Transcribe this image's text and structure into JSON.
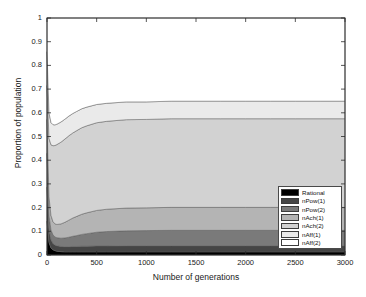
{
  "chart_data": {
    "type": "area",
    "stacked": true,
    "title": "",
    "xlabel": "Number of generations",
    "ylabel": "Proportion of population",
    "xlim": [
      0,
      3000
    ],
    "ylim": [
      0,
      1
    ],
    "xticks": [
      0,
      500,
      1000,
      1500,
      2000,
      2500,
      3000
    ],
    "yticks": [
      "0",
      "0.1",
      "0.2",
      "0.3",
      "0.4",
      "0.5",
      "0.6",
      "0.7",
      "0.8",
      "0.9",
      "1"
    ],
    "grid": false,
    "legend_position": "lower right",
    "x": [
      0,
      20,
      40,
      60,
      80,
      100,
      140,
      180,
      220,
      260,
      300,
      350,
      400,
      500,
      600,
      800,
      1000,
      1250,
      1500,
      1750,
      2000,
      2250,
      2500,
      2750,
      3000
    ],
    "series": [
      {
        "name": "Rational",
        "color": "#000000",
        "values": [
          0.143,
          0.052,
          0.03,
          0.022,
          0.018,
          0.016,
          0.014,
          0.013,
          0.013,
          0.013,
          0.013,
          0.013,
          0.013,
          0.013,
          0.013,
          0.013,
          0.013,
          0.013,
          0.013,
          0.013,
          0.013,
          0.013,
          0.013,
          0.013,
          0.013
        ]
      },
      {
        "name": "nPow(1)",
        "color": "#454545",
        "values": [
          0.143,
          0.055,
          0.034,
          0.027,
          0.024,
          0.023,
          0.022,
          0.022,
          0.022,
          0.023,
          0.023,
          0.024,
          0.024,
          0.025,
          0.025,
          0.026,
          0.026,
          0.026,
          0.026,
          0.026,
          0.026,
          0.026,
          0.026,
          0.026,
          0.026
        ]
      },
      {
        "name": "nPow(2)",
        "color": "#7a7a7a",
        "values": [
          0.143,
          0.06,
          0.042,
          0.036,
          0.034,
          0.034,
          0.035,
          0.037,
          0.04,
          0.043,
          0.046,
          0.05,
          0.053,
          0.058,
          0.061,
          0.063,
          0.064,
          0.065,
          0.065,
          0.065,
          0.065,
          0.065,
          0.065,
          0.065,
          0.065
        ]
      },
      {
        "name": "nAch(1)",
        "color": "#b4b4b4",
        "values": [
          0.143,
          0.079,
          0.061,
          0.056,
          0.055,
          0.056,
          0.06,
          0.066,
          0.072,
          0.077,
          0.081,
          0.085,
          0.088,
          0.092,
          0.094,
          0.096,
          0.096,
          0.097,
          0.097,
          0.097,
          0.097,
          0.097,
          0.097,
          0.097,
          0.097
        ]
      },
      {
        "name": "nAch(2)",
        "color": "#d2d2d2",
        "values": [
          0.143,
          0.246,
          0.298,
          0.32,
          0.331,
          0.337,
          0.345,
          0.351,
          0.356,
          0.359,
          0.362,
          0.365,
          0.367,
          0.37,
          0.371,
          0.373,
          0.373,
          0.374,
          0.374,
          0.374,
          0.374,
          0.374,
          0.374,
          0.374,
          0.374
        ]
      },
      {
        "name": "nAff(1)",
        "color": "#eaeaea",
        "values": [
          0.143,
          0.108,
          0.094,
          0.089,
          0.087,
          0.086,
          0.085,
          0.084,
          0.083,
          0.082,
          0.081,
          0.08,
          0.079,
          0.077,
          0.076,
          0.075,
          0.074,
          0.074,
          0.074,
          0.074,
          0.074,
          0.074,
          0.074,
          0.074,
          0.074
        ]
      },
      {
        "name": "nAff(2)",
        "color": "#ffffff",
        "values": [
          0.142,
          0.4,
          0.441,
          0.45,
          0.451,
          0.448,
          0.439,
          0.427,
          0.414,
          0.403,
          0.394,
          0.383,
          0.376,
          0.365,
          0.36,
          0.354,
          0.354,
          0.351,
          0.351,
          0.351,
          0.351,
          0.351,
          0.351,
          0.351,
          0.351
        ]
      }
    ]
  },
  "legend": {
    "items": [
      {
        "label": "Rational",
        "color": "#000000"
      },
      {
        "label": "nPow(1)",
        "color": "#454545"
      },
      {
        "label": "nPow(2)",
        "color": "#7a7a7a"
      },
      {
        "label": "nAch(1)",
        "color": "#b4b4b4"
      },
      {
        "label": "nAch(2)",
        "color": "#d2d2d2"
      },
      {
        "label": "nAff(1)",
        "color": "#eaeaea"
      },
      {
        "label": "nAff(2)",
        "color": "#ffffff"
      }
    ]
  }
}
